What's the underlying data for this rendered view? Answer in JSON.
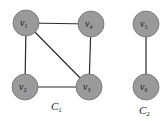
{
  "diagram": {
    "components": [
      {
        "name": "C",
        "sub": "1",
        "label_pos": [
          56,
          109
        ]
      },
      {
        "name": "C",
        "sub": "2",
        "label_pos": [
          143,
          113
        ]
      }
    ],
    "nodes": [
      {
        "id": "v1",
        "name": "v",
        "sub": "1",
        "x": 26,
        "y": 23
      },
      {
        "id": "v4",
        "name": "v",
        "sub": "4",
        "x": 91,
        "y": 24
      },
      {
        "id": "v2",
        "name": "v",
        "sub": "2",
        "x": 25,
        "y": 87
      },
      {
        "id": "v3",
        "name": "v",
        "sub": "3",
        "x": 89,
        "y": 87
      },
      {
        "id": "v5",
        "name": "v",
        "sub": "5",
        "x": 146,
        "y": 24
      },
      {
        "id": "v6",
        "name": "v",
        "sub": "6",
        "x": 146,
        "y": 87
      }
    ],
    "edges": [
      [
        "v1",
        "v4"
      ],
      [
        "v1",
        "v2"
      ],
      [
        "v1",
        "v3"
      ],
      [
        "v4",
        "v3"
      ],
      [
        "v2",
        "v3"
      ],
      [
        "v5",
        "v6"
      ]
    ],
    "colors": {
      "node_fill": "#9a9a9a",
      "edge": "#2a2a2a",
      "background": "#ffffff"
    }
  }
}
